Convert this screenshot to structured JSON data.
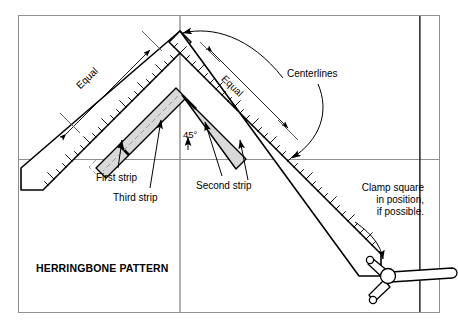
{
  "figure": {
    "title": "HERRINGBONE PATTERN",
    "labels": {
      "equal_left": "Equal",
      "equal_right": "Equal",
      "centerlines": "Centerlines",
      "angle_45": "45°",
      "first_strip": "First strip",
      "second_strip": "Second strip",
      "third_strip": "Third strip",
      "clamp_note": "Clamp square\nin position,\nif possible."
    },
    "colors": {
      "ink": "#000000",
      "centerline": "#8a8a8a",
      "strip_fill": "#d9d9d9",
      "frame": "#8a8a8a",
      "tool_fill": "#ffffff"
    },
    "geometry": {
      "apex_x": 180,
      "apex_y": 42,
      "centerline_vertical_x": 180,
      "centerline_horizontal_y": 159,
      "frame_left": 18,
      "frame_right": 440,
      "frame_top": 15,
      "frame_bottom": 313,
      "blade_angle_left_deg": -45,
      "blade_angle_right_deg": 45
    }
  }
}
